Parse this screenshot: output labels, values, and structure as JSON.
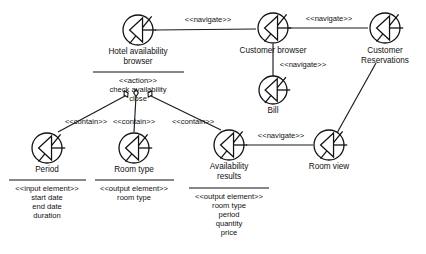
{
  "diagram": {
    "type": "uml-web-navigation-diagram",
    "background_color": "#ffffff",
    "line_color": "#111111",
    "text_color": "#111111",
    "node_icon_name": "web-page-icon",
    "nodes": [
      {
        "id": "hotel-availability-browser",
        "title_lines": [
          "Hotel availability",
          "browser"
        ],
        "stereotype": "<<action>>",
        "attributes": [
          "check availability",
          "close"
        ],
        "has_separator": true,
        "icon_cx": 138,
        "icon_cy": 30,
        "icon_r": 15,
        "title_x": 138,
        "title_y": 52,
        "separator_x1": 93,
        "separator_x2": 184,
        "separator_y": 72
      },
      {
        "id": "customer-browser",
        "title_lines": [
          "Customer browser"
        ],
        "stereotype": "",
        "attributes": [],
        "has_separator": false,
        "icon_cx": 273,
        "icon_cy": 28,
        "icon_r": 15,
        "title_x": 273,
        "title_y": 51
      },
      {
        "id": "customer-reservations",
        "title_lines": [
          "Customer",
          "Reservations"
        ],
        "stereotype": "",
        "attributes": [],
        "has_separator": false,
        "icon_cx": 385,
        "icon_cy": 28,
        "icon_r": 15,
        "title_x": 385,
        "title_y": 51
      },
      {
        "id": "bill",
        "title_lines": [
          "Bill"
        ],
        "stereotype": "",
        "attributes": [],
        "has_separator": false,
        "icon_cx": 273,
        "icon_cy": 90,
        "icon_r": 14,
        "title_x": 273,
        "title_y": 111
      },
      {
        "id": "period",
        "title_lines": [
          "Period"
        ],
        "stereotype": "<<input element>>",
        "attributes": [
          "start date",
          "end date",
          "duration"
        ],
        "has_separator": true,
        "icon_cx": 47,
        "icon_cy": 148,
        "icon_r": 15,
        "title_x": 47,
        "title_y": 170,
        "separator_x1": 9,
        "separator_x2": 86,
        "separator_y": 180
      },
      {
        "id": "room-type",
        "title_lines": [
          "Room type"
        ],
        "stereotype": "<<output element>>",
        "attributes": [
          "room type"
        ],
        "has_separator": true,
        "icon_cx": 134,
        "icon_cy": 148,
        "icon_r": 15,
        "title_x": 134,
        "title_y": 170,
        "separator_x1": 95,
        "separator_x2": 174,
        "separator_y": 180
      },
      {
        "id": "availability-results",
        "title_lines": [
          "Availability",
          "results"
        ],
        "stereotype": "<<output element>>",
        "attributes": [
          "room type",
          "period",
          "quantity",
          "price"
        ],
        "has_separator": true,
        "icon_cx": 229,
        "icon_cy": 145,
        "icon_r": 15,
        "title_x": 229,
        "title_y": 167,
        "separator_x1": 189,
        "separator_x2": 269,
        "separator_y": 188
      },
      {
        "id": "room-view",
        "title_lines": [
          "Room view"
        ],
        "stereotype": "",
        "attributes": [],
        "has_separator": false,
        "icon_cx": 329,
        "icon_cy": 145,
        "icon_r": 15,
        "title_x": 329,
        "title_y": 167
      }
    ],
    "edges": [
      {
        "id": "hotel-to-customer-browser",
        "label": "<<navigate>>",
        "from": "hotel-availability-browser",
        "to": "customer-browser",
        "path": "M 155 30 L 256 29",
        "label_x": 208,
        "label_y": 20
      },
      {
        "id": "customer-browser-to-reservations",
        "label": "<<navigate>>",
        "from": "customer-browser",
        "to": "customer-reservations",
        "path": "M 289 28 L 368 28",
        "label_x": 329,
        "label_y": 19
      },
      {
        "id": "customer-browser-to-bill",
        "label": "<<navigate>>",
        "from": "customer-browser",
        "to": "bill",
        "path": "M 273 44 L 273 76",
        "label_x": 303,
        "label_y": 65
      },
      {
        "id": "availability-to-room-view",
        "label": "<<navigate>>",
        "from": "availability-results",
        "to": "room-view",
        "path": "M 246 145 L 313 145",
        "label_x": 281,
        "label_y": 136
      },
      {
        "id": "reservations-to-room-view",
        "label": "",
        "from": "customer-reservations",
        "to": "room-view",
        "path": "M 376 63 L 337 133",
        "label_x": 0,
        "label_y": 0
      },
      {
        "id": "contain-period",
        "label": "<<contain>>",
        "from": "hotel-availability-browser",
        "to": "period",
        "path": "M 125 96 L 58 132",
        "label_x": 86,
        "label_y": 122,
        "diamond_cx": 126,
        "diamond_cy": 94,
        "diamond_angle": -28
      },
      {
        "id": "contain-room-type",
        "label": "<<contain>>",
        "from": "hotel-availability-browser",
        "to": "room-type",
        "path": "M 136 96 L 134 132",
        "label_x": 134,
        "label_y": 122,
        "diamond_cx": 136,
        "diamond_cy": 93,
        "diamond_angle": 0
      },
      {
        "id": "contain-availability-results",
        "label": "<<contain>>",
        "from": "hotel-availability-browser",
        "to": "availability-results",
        "path": "M 151 96 L 221 130",
        "label_x": 193,
        "label_y": 122,
        "diamond_cx": 150,
        "diamond_cy": 94,
        "diamond_angle": 28
      }
    ]
  }
}
